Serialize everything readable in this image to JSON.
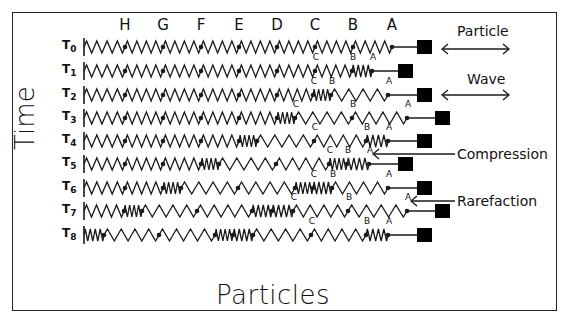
{
  "diagram": {
    "x_axis_label": "Particles",
    "y_axis_label": "Time",
    "column_labels": [
      {
        "text": "H",
        "x": 125
      },
      {
        "text": "G",
        "x": 163
      },
      {
        "text": "F",
        "x": 201
      },
      {
        "text": "E",
        "x": 239
      },
      {
        "text": "D",
        "x": 277
      },
      {
        "text": "C",
        "x": 315
      },
      {
        "text": "B",
        "x": 353
      },
      {
        "text": "A",
        "x": 392
      }
    ],
    "legend": {
      "particle": "Particle",
      "wave": "Wave",
      "compression": "Compression",
      "rarefaction": "Rarefaction"
    },
    "wall_x": 84,
    "rows": [
      {
        "label": "T",
        "sub": "0",
        "y": 47,
        "particles": [
          125,
          163,
          201,
          239,
          277,
          315,
          353,
          392
        ],
        "block_x": 424,
        "marks": []
      },
      {
        "label": "T",
        "sub": "1",
        "y": 71,
        "particles": [
          125,
          163,
          201,
          239,
          277,
          315,
          352,
          372
        ],
        "block_x": 405,
        "marks": [
          "C",
          "B",
          "A"
        ]
      },
      {
        "label": "T",
        "sub": "2",
        "y": 95,
        "particles": [
          125,
          163,
          201,
          239,
          277,
          313,
          331,
          388
        ],
        "block_x": 424,
        "marks": [
          "C",
          "B",
          "A"
        ]
      },
      {
        "label": "T",
        "sub": "3",
        "y": 118,
        "particles": [
          125,
          163,
          201,
          239,
          277,
          295,
          352,
          407
        ],
        "block_x": 442,
        "marks": [
          "C",
          "B",
          "A"
        ]
      },
      {
        "label": "T",
        "sub": "4",
        "y": 141,
        "particles": [
          125,
          163,
          201,
          239,
          257,
          314,
          366,
          388
        ],
        "block_x": 424,
        "marks": [
          "C",
          "B",
          "A"
        ]
      },
      {
        "label": "T",
        "sub": "5",
        "y": 164,
        "particles": [
          125,
          163,
          201,
          219,
          276,
          329,
          347,
          369
        ],
        "block_x": 405,
        "marks": [
          "C",
          "B",
          "A"
        ]
      },
      {
        "label": "T",
        "sub": "6",
        "y": 188,
        "particles": [
          125,
          163,
          181,
          238,
          295,
          313,
          332,
          388
        ],
        "block_x": 424,
        "marks": [
          "C",
          "B",
          "A"
        ]
      },
      {
        "label": "T",
        "sub": "7",
        "y": 211,
        "particles": [
          124,
          142,
          197,
          252,
          272,
          293,
          348,
          407
        ],
        "block_x": 442,
        "marks": [
          "C",
          "B",
          "A"
        ]
      },
      {
        "label": "T",
        "sub": "8",
        "y": 235,
        "particles": [
          104,
          159,
          215,
          233,
          253,
          311,
          366,
          388
        ],
        "block_x": 424,
        "marks": [
          "C",
          "B",
          "A"
        ]
      }
    ],
    "colors": {
      "line": "#1a1a1a",
      "block": "#000000",
      "background": "#ffffff"
    }
  }
}
